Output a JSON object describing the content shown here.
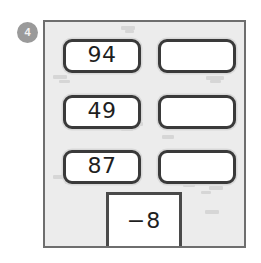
{
  "badge": {
    "label": "4",
    "color": "#9a9a9a",
    "text_color": "#f2f2f2"
  },
  "worksheet": {
    "background_color": "#ececec",
    "border_color": "#6e6e6e",
    "rows": [
      {
        "left_value": "94",
        "right_value": ""
      },
      {
        "left_value": "49",
        "right_value": ""
      },
      {
        "left_value": "87",
        "right_value": ""
      }
    ],
    "total_box": {
      "value": "−8"
    }
  },
  "smudges": [
    {
      "left": 76,
      "top": 4,
      "width": 14,
      "height": 4
    },
    {
      "left": 80,
      "top": 8,
      "width": 9,
      "height": 3
    },
    {
      "left": 8,
      "top": 53,
      "width": 14,
      "height": 4
    },
    {
      "left": 14,
      "top": 58,
      "width": 11,
      "height": 3
    },
    {
      "left": 161,
      "top": 54,
      "width": 18,
      "height": 4
    },
    {
      "left": 165,
      "top": 58,
      "width": 11,
      "height": 3
    },
    {
      "left": 88,
      "top": 100,
      "width": 10,
      "height": 4
    },
    {
      "left": 76,
      "top": 106,
      "width": 12,
      "height": 3
    },
    {
      "left": 117,
      "top": 113,
      "width": 12,
      "height": 4
    },
    {
      "left": 8,
      "top": 153,
      "width": 14,
      "height": 4
    },
    {
      "left": 20,
      "top": 159,
      "width": 13,
      "height": 3
    },
    {
      "left": 148,
      "top": 157,
      "width": 17,
      "height": 4
    },
    {
      "left": 138,
      "top": 162,
      "width": 12,
      "height": 3
    },
    {
      "left": 164,
      "top": 164,
      "width": 14,
      "height": 4
    },
    {
      "left": 156,
      "top": 169,
      "width": 10,
      "height": 3
    },
    {
      "left": 160,
      "top": 188,
      "width": 14,
      "height": 4
    }
  ]
}
